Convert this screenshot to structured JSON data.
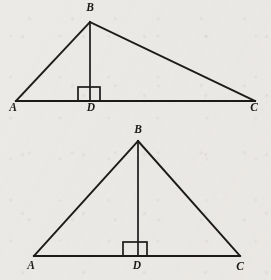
{
  "figure": {
    "background_color": "#eceae7",
    "ink_color": "#1c1b1a",
    "diagrams": [
      {
        "name": "scalene-triangle-with-altitude",
        "description": "Obtuse-looking scalene triangle ABC with altitude from B meeting AC at D near the left",
        "labels": {
          "apex": "B",
          "left_base": "A",
          "right_base": "C",
          "foot_of_altitude": "D"
        },
        "points": {
          "A": [
            16,
            101
          ],
          "B": [
            90,
            22
          ],
          "C": [
            255,
            101
          ],
          "D": [
            90,
            101
          ]
        },
        "right_angle_marker": {
          "x": 78,
          "y": 87,
          "width": 22,
          "height": 14
        },
        "label_positions": {
          "A": [
            13,
            111
          ],
          "B": [
            90,
            11
          ],
          "C": [
            254,
            111
          ],
          "D": [
            91,
            111
          ]
        }
      },
      {
        "name": "isosceles-triangle-with-altitude",
        "description": "Nearly isosceles triangle ABC with altitude from B meeting AC at D near the middle",
        "labels": {
          "apex": "B",
          "left_base": "A",
          "right_base": "C",
          "foot_of_altitude": "D"
        },
        "points": {
          "A": [
            34,
            256
          ],
          "B": [
            138,
            141
          ],
          "C": [
            240,
            256
          ],
          "D": [
            138,
            256
          ]
        },
        "right_angle_marker": {
          "x": 123,
          "y": 242,
          "width": 24,
          "height": 14
        },
        "label_positions": {
          "A": [
            31,
            269
          ],
          "B": [
            138,
            133
          ],
          "C": [
            240,
            270
          ],
          "D": [
            137,
            269
          ]
        }
      }
    ]
  }
}
